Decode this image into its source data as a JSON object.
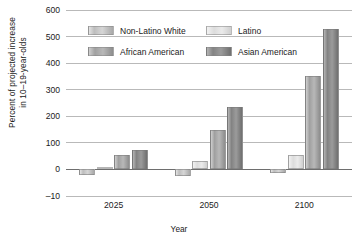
{
  "chart_data": {
    "type": "bar",
    "title": "",
    "xlabel": "Year",
    "ylabel": "Percent of projected increase\nin 10–19-year-olds",
    "categories": [
      "2025",
      "2050",
      "2100"
    ],
    "yticks": [
      "–10",
      "0",
      "100",
      "200",
      "300",
      "400",
      "500",
      "600"
    ],
    "ytick_values": [
      -10,
      0,
      100,
      200,
      300,
      400,
      500,
      600
    ],
    "ylim": [
      -10,
      600
    ],
    "grid": true,
    "legend_position": "inside-top-left",
    "series": [
      {
        "name": "Non-Latino White",
        "color": "#c8c8c8",
        "values": [
          -7,
          -8,
          -5
        ]
      },
      {
        "name": "Latino",
        "color": "#e3e3e3",
        "values": [
          10,
          30,
          55
        ]
      },
      {
        "name": "African American",
        "color": "#ababab",
        "values": [
          55,
          150,
          350
        ]
      },
      {
        "name": "Asian American",
        "color": "#8a8a8a",
        "values": [
          75,
          235,
          530
        ]
      }
    ]
  },
  "legend": {
    "items": [
      {
        "label": "Non-Latino White"
      },
      {
        "label": "Latino"
      },
      {
        "label": "African American"
      },
      {
        "label": "Asian American"
      }
    ]
  }
}
